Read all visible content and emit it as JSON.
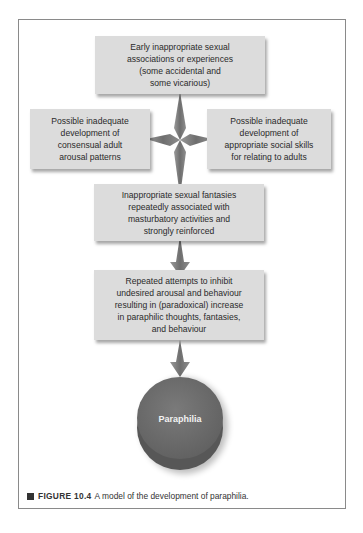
{
  "diagram": {
    "nodes": [
      {
        "id": "early",
        "text_lines": [
          "Early inappropriate sexual",
          "associations or experiences",
          "(some accidental and",
          "some vicarious)"
        ]
      },
      {
        "id": "left",
        "text_lines": [
          "Possible inadequate",
          "development of",
          "consensual adult",
          "arousal patterns"
        ]
      },
      {
        "id": "right",
        "text_lines": [
          "Possible inadequate",
          "development of",
          "appropriate social skills",
          "for relating to adults"
        ]
      },
      {
        "id": "fantasies",
        "text_lines": [
          "Inappropriate sexual fantasies",
          "repeatedly associated with",
          "masturbatory activities and",
          "strongly reinforced"
        ]
      },
      {
        "id": "inhibit",
        "text_lines": [
          "Repeated attempts to inhibit",
          "undesired arousal and behaviour",
          "resulting in (paradoxical) increase",
          "in paraphilic thoughts, fantasies,",
          "and behaviour"
        ]
      },
      {
        "id": "outcome",
        "label": "Paraphilia"
      }
    ],
    "edges": [
      {
        "from": "early",
        "to": "left"
      },
      {
        "from": "early",
        "to": "right"
      },
      {
        "from": "early",
        "to": "fantasies"
      },
      {
        "from": "fantasies",
        "to": "inhibit"
      },
      {
        "from": "inhibit",
        "to": "outcome"
      }
    ],
    "colors": {
      "box_fill": "#dcdcdc",
      "arrow": "#7d7d7d",
      "disk": "#6f6f6f",
      "disk_side": "#555555"
    }
  },
  "caption": {
    "figure_label": "FIGURE 10.4",
    "text": "A model of the development of paraphilia."
  }
}
